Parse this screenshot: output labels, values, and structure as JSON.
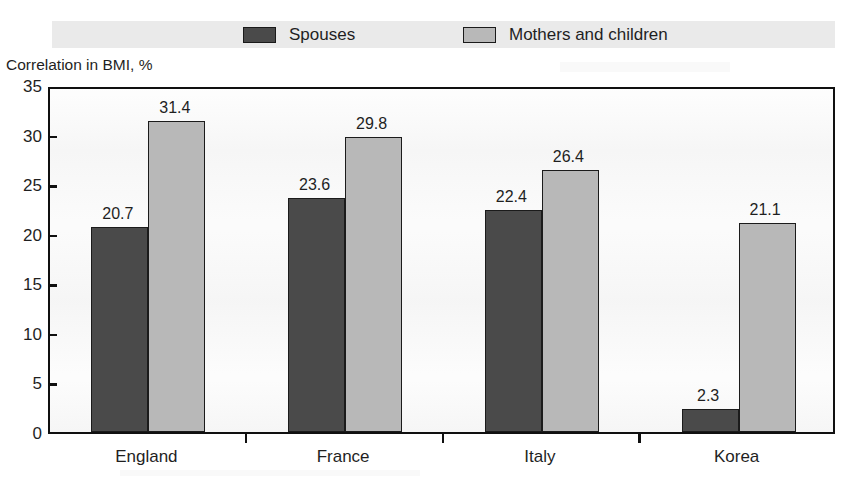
{
  "legend": {
    "items": [
      {
        "label": "Spouses",
        "swatch": "dark",
        "color": "#4a4a4a"
      },
      {
        "label": "Mothers and children",
        "swatch": "light",
        "color": "#b8b8b8"
      }
    ]
  },
  "axis": {
    "y_title": "Correlation in BMI, %",
    "y_ticks": [
      "0",
      "5",
      "10",
      "15",
      "20",
      "25",
      "30",
      "35"
    ]
  },
  "chart_data": {
    "type": "bar",
    "title": "",
    "subtitle": "",
    "xlabel": "",
    "ylabel": "Correlation in BMI, %",
    "ylim": [
      0,
      35
    ],
    "ytick_step": 5,
    "grid": false,
    "legend_position": "top",
    "categories": [
      "England",
      "France",
      "Italy",
      "Korea"
    ],
    "series": [
      {
        "name": "Spouses",
        "color": "#4a4a4a",
        "values": [
          20.7,
          23.6,
          22.4,
          2.3
        ],
        "labels": [
          "20.7",
          "23.6",
          "22.4",
          "2.3"
        ]
      },
      {
        "name": "Mothers and children",
        "color": "#b8b8b8",
        "values": [
          31.4,
          29.8,
          26.4,
          21.1
        ],
        "labels": [
          "31.4",
          "29.8",
          "26.4",
          "21.1"
        ]
      }
    ]
  },
  "colors": {
    "legend_band": "#eaeaea",
    "axis": "#101010",
    "plot_background": "#f6f6f6",
    "text": "#1f1f1f"
  }
}
